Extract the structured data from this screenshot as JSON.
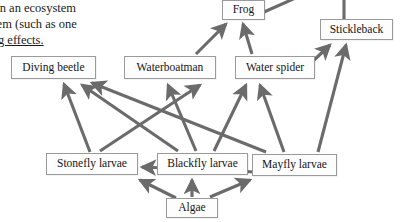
{
  "document": {
    "paragraph_lines": [
      {
        "text": "gs in an ecosystem",
        "underlined": false
      },
      {
        "text": "ystem (such as one",
        "underlined": false
      },
      {
        "text": "hing effects.",
        "underlined": true
      }
    ]
  },
  "diagram": {
    "type": "food-web",
    "edge_color": "#6b6b6b",
    "box_border_color": "#9a9a9a",
    "box_fill_color": "#fdfdfd",
    "nodes": [
      {
        "id": "frog",
        "label": "Frog",
        "x": 222,
        "y": 0,
        "w": 43,
        "h": 20
      },
      {
        "id": "stickleback",
        "label": "Stickleback",
        "x": 320,
        "y": 19,
        "w": 73,
        "h": 21
      },
      {
        "id": "diving_beetle",
        "label": "Diving beetle",
        "x": 11,
        "y": 56,
        "w": 85,
        "h": 23
      },
      {
        "id": "waterboatman",
        "label": "Waterboatman",
        "x": 124,
        "y": 56,
        "w": 92,
        "h": 23
      },
      {
        "id": "water_spider",
        "label": "Water spider",
        "x": 235,
        "y": 56,
        "w": 80,
        "h": 23
      },
      {
        "id": "stonefly",
        "label": "Stonefly larvae",
        "x": 46,
        "y": 153,
        "w": 92,
        "h": 22
      },
      {
        "id": "blackfly",
        "label": "Blackfly larvae",
        "x": 157,
        "y": 153,
        "w": 91,
        "h": 22
      },
      {
        "id": "mayfly",
        "label": "Mayfly larvae",
        "x": 252,
        "y": 154,
        "w": 85,
        "h": 22
      },
      {
        "id": "algae",
        "label": "Algae",
        "x": 166,
        "y": 198,
        "w": 52,
        "h": 20
      }
    ],
    "edges": [
      {
        "from": "algae",
        "to": "stonefly"
      },
      {
        "from": "algae",
        "to": "blackfly"
      },
      {
        "from": "algae",
        "to": "mayfly"
      },
      {
        "from": "stonefly",
        "to": "diving_beetle"
      },
      {
        "from": "stonefly",
        "to": "waterboatman"
      },
      {
        "from": "blackfly",
        "to": "diving_beetle"
      },
      {
        "from": "blackfly",
        "to": "waterboatman"
      },
      {
        "from": "blackfly",
        "to": "water_spider"
      },
      {
        "from": "mayfly",
        "to": "diving_beetle"
      },
      {
        "from": "mayfly",
        "to": "water_spider"
      },
      {
        "from": "mayfly",
        "to": "stonefly"
      },
      {
        "from": "mayfly",
        "to": "stickleback"
      },
      {
        "from": "water_spider",
        "to": "stickleback"
      },
      {
        "from": "waterboatman",
        "to": "frog"
      },
      {
        "from": "water_spider",
        "to": "frog"
      },
      {
        "from": "frog",
        "to": "offscreen-top-right"
      },
      {
        "from": "stickleback",
        "to": "offscreen-top"
      }
    ]
  }
}
